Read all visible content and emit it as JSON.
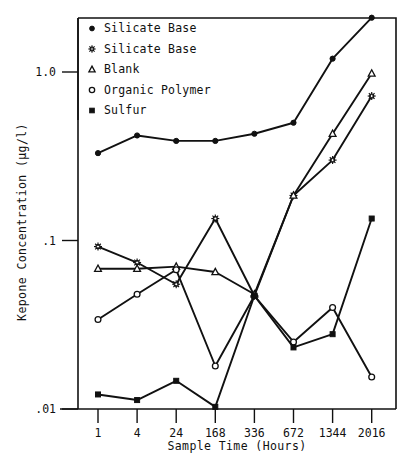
{
  "chart_data": {
    "type": "line",
    "title": "",
    "xlabel": "Sample Time (Hours)",
    "ylabel": "Kepone Concentration (µg/l)",
    "x_scale": "categorical",
    "y_scale": "log",
    "ylim": [
      0.01,
      2.5
    ],
    "grid": false,
    "legend_position": "top-left",
    "categories": [
      "1",
      "4",
      "24",
      "168",
      "336",
      "672",
      "1344",
      "2016"
    ],
    "y_tick_labels": [
      "1.0",
      ".1",
      ".01"
    ],
    "y_tick_values": [
      1.0,
      0.1,
      0.01
    ],
    "series": [
      {
        "name": "Silicate Base",
        "marker": "filled-circle",
        "values": [
          0.33,
          0.42,
          0.39,
          0.39,
          0.43,
          0.5,
          1.2,
          2.1
        ]
      },
      {
        "name": "Silicate Base",
        "marker": "star",
        "values": [
          0.092,
          0.074,
          0.055,
          0.135,
          0.047,
          0.185,
          0.3,
          0.72
        ]
      },
      {
        "name": "Blank",
        "marker": "open-triangle",
        "values": [
          0.068,
          0.068,
          0.07,
          0.065,
          0.048,
          0.185,
          0.43,
          0.98
        ]
      },
      {
        "name": "Organic Polymer",
        "marker": "open-circle",
        "values": [
          0.034,
          0.048,
          0.067,
          0.018,
          0.047,
          0.025,
          0.04,
          0.0155
        ]
      },
      {
        "name": "Sulfur",
        "marker": "filled-square",
        "values": [
          0.0122,
          0.0113,
          0.0147,
          0.0103,
          0.047,
          0.0232,
          0.0278,
          0.135
        ]
      }
    ]
  },
  "legend": {
    "items": [
      {
        "label": "Silicate Base",
        "marker": "filled-circle"
      },
      {
        "label": "Silicate Base",
        "marker": "star"
      },
      {
        "label": "Blank",
        "marker": "open-triangle"
      },
      {
        "label": "Organic Polymer",
        "marker": "open-circle"
      },
      {
        "label": "Sulfur",
        "marker": "filled-square"
      }
    ]
  },
  "axes": {
    "x_title": "Sample Time (Hours)",
    "y_title": "Kepone Concentration (µg/l)"
  },
  "colors": {
    "ink": "#111111",
    "paper": "#ffffff"
  }
}
